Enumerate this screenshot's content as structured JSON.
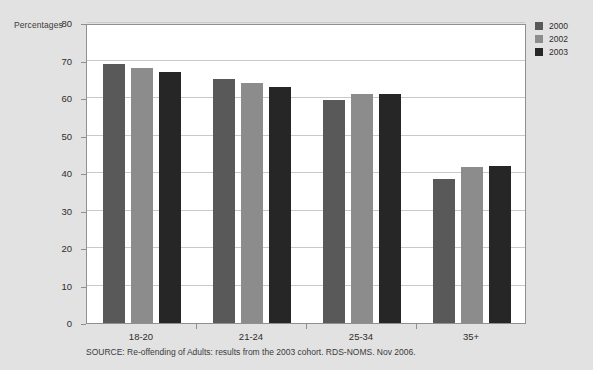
{
  "chart_data": {
    "type": "bar",
    "title": "",
    "subtitle": "",
    "xlabel": "",
    "ylabel": "Percentages",
    "ylim": [
      0,
      80
    ],
    "yticks": [
      0,
      10,
      20,
      30,
      40,
      50,
      60,
      70,
      80
    ],
    "ytick_labels": [
      "0",
      "10",
      "20",
      "30",
      "40",
      "50",
      "60",
      "70",
      "80"
    ],
    "grid": true,
    "legend_position": "right",
    "categories": [
      "18-20",
      "21-24",
      "25-34",
      "35+"
    ],
    "series": [
      {
        "name": "2000",
        "color": "#595959",
        "values": [
          69.0,
          65.0,
          59.5,
          38.5
        ]
      },
      {
        "name": "2002",
        "color": "#8c8c8c",
        "values": [
          68.0,
          64.0,
          61.0,
          41.5
        ]
      },
      {
        "name": "2003",
        "color": "#262626",
        "values": [
          67.0,
          63.0,
          61.0,
          42.0
        ]
      }
    ],
    "source": "SOURCE: Re-offending of Adults: results from the 2003 cohort. RDS-NOMS. Nov 2006."
  },
  "colors": {
    "background": "#e2e2e2",
    "plot_background": "#ffffff",
    "axis": "#8f8f8f",
    "gridline": "#c9c9c9",
    "text": "#2d2d2d"
  }
}
